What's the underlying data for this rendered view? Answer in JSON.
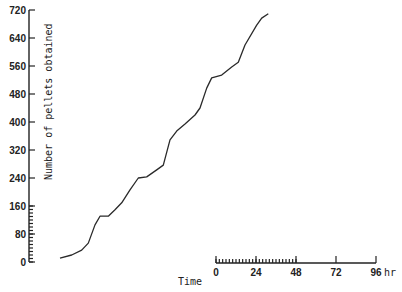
{
  "chart_data": {
    "type": "line",
    "title": "",
    "ylabel": "Number of pellets obtained",
    "xlabel": "Time",
    "ylim": [
      0,
      720
    ],
    "y_ticks": [
      0,
      80,
      160,
      240,
      320,
      400,
      480,
      560,
      640,
      720
    ],
    "y_tick_labels": [
      "0",
      "80",
      "160",
      "240",
      "320",
      "400",
      "480",
      "560",
      "640",
      "720"
    ],
    "y_minor_ticks_below": 160,
    "y_minor_step": 10,
    "time_scale_bar": {
      "ticks": [
        0,
        24,
        48,
        72,
        96
      ],
      "tick_labels": [
        "0",
        "24",
        "48",
        "72",
        "96"
      ],
      "unit": "hr",
      "minor_ticks_range": [
        0,
        48
      ],
      "minor_step": 2
    },
    "grid": false,
    "legend": null,
    "series": [
      {
        "name": "Cumulative pellets",
        "x_hours": [
          0,
          7,
          13,
          17,
          21,
          24,
          29,
          33,
          37,
          42,
          47,
          52,
          58,
          62,
          66,
          70,
          75,
          81,
          84,
          88,
          91,
          97,
          103,
          107,
          111,
          118,
          121,
          125
        ],
        "values": [
          11,
          20,
          34,
          54,
          106,
          131,
          131,
          149,
          169,
          206,
          240,
          243,
          263,
          277,
          349,
          374,
          394,
          420,
          440,
          497,
          526,
          534,
          557,
          571,
          620,
          677,
          697,
          709
        ]
      }
    ]
  },
  "labels": {
    "ylabel": "Number of pellets obtained",
    "xlabel": "Time",
    "unit": "hr"
  }
}
